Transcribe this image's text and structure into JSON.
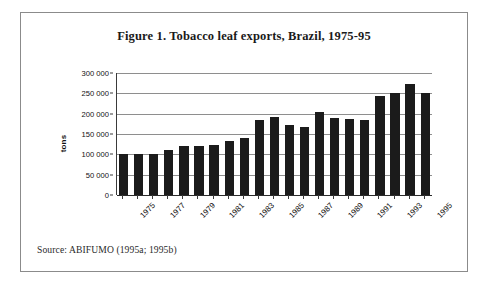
{
  "figure": {
    "title": "Figure 1. Tobacco leaf exports, Brazil, 1975-95",
    "source": "Source: ABIFUMO (1995a; 1995b)",
    "frame_color": "#8b8b8b",
    "bar_color": "#1b1b1b",
    "grid_color": "#8e8e8e"
  },
  "chart_data": {
    "type": "bar",
    "title": "Figure 1. Tobacco leaf exports, Brazil, 1975-95",
    "xlabel": "",
    "ylabel": "tons",
    "ylim": [
      0,
      300000
    ],
    "yticks": [
      "0",
      "50 000",
      "100 000",
      "150 000",
      "200 000",
      "250 000",
      "300 000"
    ],
    "ytick_values": [
      0,
      50000,
      100000,
      150000,
      200000,
      250000,
      300000
    ],
    "grid": true,
    "legend": "none",
    "categories": [
      "1975",
      "1976",
      "1977",
      "1978",
      "1979",
      "1980",
      "1981",
      "1982",
      "1983",
      "1984",
      "1985",
      "1986",
      "1987",
      "1988",
      "1989",
      "1990",
      "1991",
      "1992",
      "1993",
      "1994",
      "1995"
    ],
    "xtick_labels": [
      "1975",
      "1977",
      "1979",
      "1981",
      "1983",
      "1985",
      "1987",
      "1989",
      "1991",
      "1993",
      "1995"
    ],
    "values": [
      100000,
      100000,
      100000,
      110000,
      120000,
      120000,
      122000,
      133000,
      140000,
      185000,
      193000,
      172000,
      168000,
      205000,
      190000,
      187000,
      185000,
      243000,
      250000,
      272000,
      252000
    ],
    "units": "tons",
    "series_name": "Tobacco leaf exports"
  }
}
